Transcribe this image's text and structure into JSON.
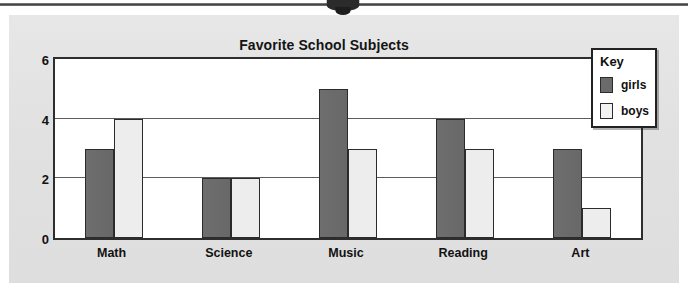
{
  "chart_data": {
    "type": "bar",
    "title": "Favorite School Subjects",
    "categories": [
      "Math",
      "Science",
      "Music",
      "Reading",
      "Art"
    ],
    "series": [
      {
        "name": "girls",
        "values": [
          3,
          2,
          5,
          4,
          3
        ],
        "color": "#6b6b6b"
      },
      {
        "name": "boys",
        "values": [
          4,
          2,
          3,
          3,
          1
        ],
        "color": "#ededed"
      }
    ],
    "xlabel": "",
    "ylabel": "",
    "ylim": [
      0,
      6
    ],
    "yticks": [
      0,
      2,
      4,
      6
    ],
    "ytick_labels": [
      "0",
      "2",
      "4",
      "6"
    ],
    "gridlines": [
      2,
      4
    ],
    "grid": true,
    "legend": {
      "title": "Key",
      "position": "top-right",
      "entries": [
        {
          "label": "girls",
          "color": "#6b6b6b"
        },
        {
          "label": "boys",
          "color": "#ededed"
        }
      ]
    }
  },
  "page": {
    "background_color": "#e3e3e3",
    "plot_background_color": "#ffffff",
    "axis_color": "#2e2e2e"
  }
}
